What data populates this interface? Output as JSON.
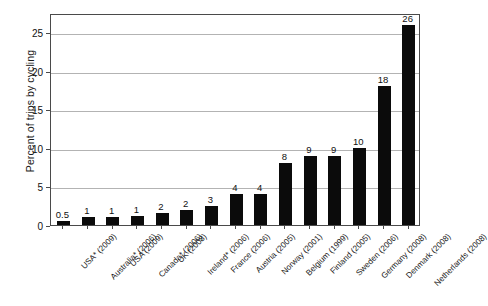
{
  "chart_data": {
    "type": "bar",
    "title": "",
    "xlabel": "",
    "ylabel": "Percent of trips by cycling",
    "ylim": [
      0,
      27.5
    ],
    "yticks": [
      0,
      5,
      10,
      15,
      20,
      25
    ],
    "ytick_labels": [
      "0",
      "5",
      "10",
      "15",
      "20",
      "25"
    ],
    "grid": true,
    "legend": "none",
    "bar_color": "#0b0b0b",
    "categories": [
      "USA* (2009)",
      "Australia* (2006)",
      "USA (2009)",
      "Canada* (2006)",
      "UK (2008)",
      "Ireland* (2006)",
      "France (2006)",
      "Austria (2005)",
      "Norway (2001)",
      "Belgium (1999)",
      "Finland (2005)",
      "Sweden (2006)",
      "Germany (2008)",
      "Denmark (2008)",
      "Netherlands (2008)"
    ],
    "values": [
      0.5,
      1,
      1,
      1.2,
      1.6,
      1.9,
      2.5,
      4,
      4,
      8,
      9,
      9,
      10,
      18,
      26
    ],
    "value_labels": [
      "0.5",
      "1",
      "1",
      "1",
      "2",
      "2",
      "3",
      "4",
      "4",
      "8",
      "9",
      "9",
      "10",
      "18",
      "26"
    ]
  }
}
